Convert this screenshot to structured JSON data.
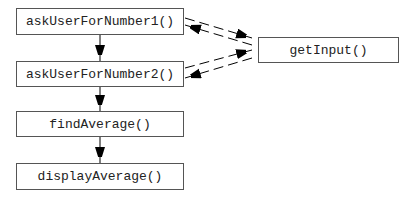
{
  "nodes": [
    {
      "id": "ask1",
      "label": "askUserForNumber1()"
    },
    {
      "id": "ask2",
      "label": "askUserForNumber2()"
    },
    {
      "id": "find",
      "label": "findAverage()"
    },
    {
      "id": "display",
      "label": "displayAverage()"
    },
    {
      "id": "getInput",
      "label": "getInput()"
    }
  ],
  "edges": [
    {
      "from": "ask1",
      "to": "ask2",
      "style": "solid"
    },
    {
      "from": "ask2",
      "to": "find",
      "style": "solid"
    },
    {
      "from": "find",
      "to": "display",
      "style": "solid"
    },
    {
      "from": "ask1",
      "to": "getInput",
      "style": "dashed"
    },
    {
      "from": "getInput",
      "to": "ask1",
      "style": "dashed"
    },
    {
      "from": "ask2",
      "to": "getInput",
      "style": "dashed"
    },
    {
      "from": "getInput",
      "to": "ask2",
      "style": "dashed"
    }
  ]
}
